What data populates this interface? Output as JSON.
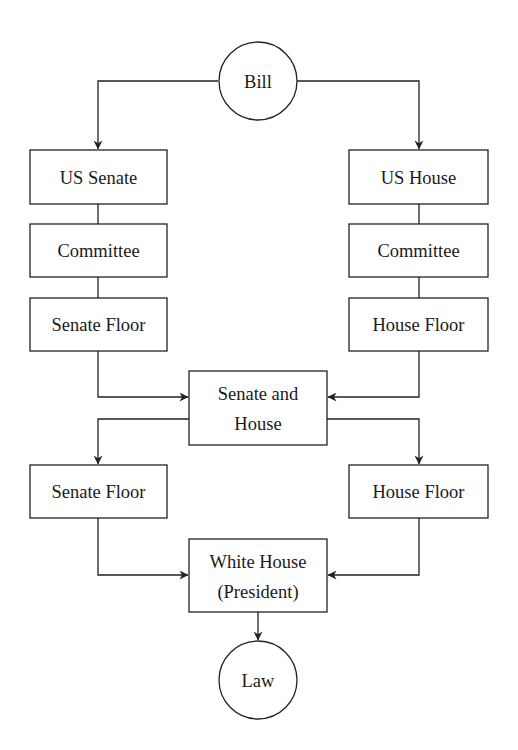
{
  "diagram": {
    "nodes": {
      "bill": {
        "label": "Bill",
        "shape": "circle"
      },
      "us_senate": {
        "label": "US Senate",
        "shape": "rect"
      },
      "us_house": {
        "label": "US House",
        "shape": "rect"
      },
      "senate_committee": {
        "label": "Committee",
        "shape": "rect"
      },
      "house_committee": {
        "label": "Committee",
        "shape": "rect"
      },
      "senate_floor_1": {
        "label": "Senate Floor",
        "shape": "rect"
      },
      "house_floor_1": {
        "label": "House Floor",
        "shape": "rect"
      },
      "senate_and_house": {
        "label_line1": "Senate and",
        "label_line2": "House",
        "shape": "rect"
      },
      "senate_floor_2": {
        "label": "Senate Floor",
        "shape": "rect"
      },
      "house_floor_2": {
        "label": "House Floor",
        "shape": "rect"
      },
      "white_house": {
        "label_line1": "White House",
        "label_line2": "(President)",
        "shape": "rect"
      },
      "law": {
        "label": "Law",
        "shape": "circle"
      }
    },
    "edges": [
      {
        "from": "bill",
        "to": "us_senate",
        "arrow": true
      },
      {
        "from": "bill",
        "to": "us_house",
        "arrow": true
      },
      {
        "from": "us_senate",
        "to": "senate_committee",
        "arrow": false
      },
      {
        "from": "senate_committee",
        "to": "senate_floor_1",
        "arrow": false
      },
      {
        "from": "us_house",
        "to": "house_committee",
        "arrow": false
      },
      {
        "from": "house_committee",
        "to": "house_floor_1",
        "arrow": false
      },
      {
        "from": "senate_floor_1",
        "to": "senate_and_house",
        "arrow": true
      },
      {
        "from": "house_floor_1",
        "to": "senate_and_house",
        "arrow": true
      },
      {
        "from": "senate_and_house",
        "to": "senate_floor_2",
        "arrow": true
      },
      {
        "from": "senate_and_house",
        "to": "house_floor_2",
        "arrow": true
      },
      {
        "from": "senate_floor_2",
        "to": "white_house",
        "arrow": true
      },
      {
        "from": "house_floor_2",
        "to": "white_house",
        "arrow": true
      },
      {
        "from": "white_house",
        "to": "law",
        "arrow": true
      }
    ],
    "colors": {
      "stroke": "#222222",
      "text": "#1a1a1a",
      "background": "#ffffff"
    }
  }
}
